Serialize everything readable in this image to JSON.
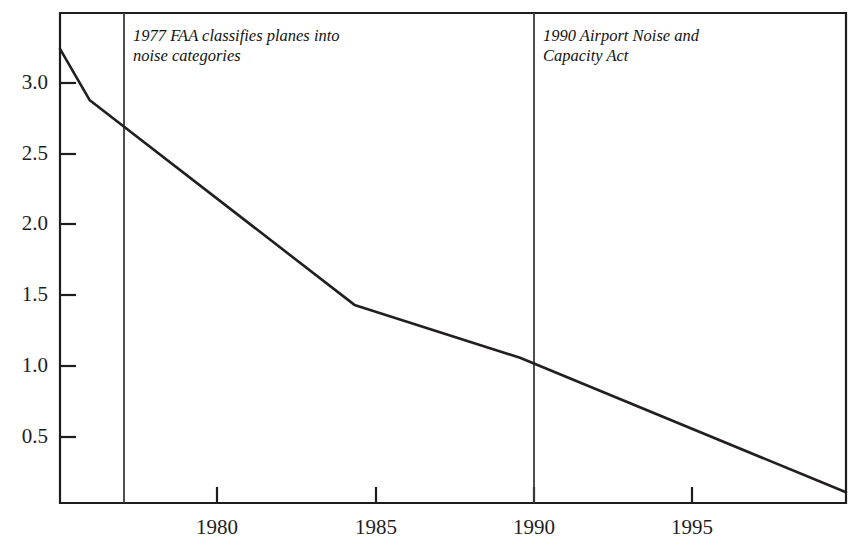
{
  "chart_data": {
    "type": "line",
    "title": "",
    "xlabel": "",
    "ylabel": "",
    "xlim": [
      1976.1,
      1999.85
    ],
    "ylim": [
      0.035,
      3.46
    ],
    "grid": false,
    "legend": null,
    "x": [
      1976.1,
      1977,
      1985,
      1990,
      1999.85
    ],
    "values": [
      3.21,
      2.85,
      1.42,
      1.05,
      0.11
    ],
    "series": [
      {
        "name": "noise-exposure-index",
        "x": [
          1976.1,
          1977,
          1985,
          1990,
          1999.85
        ],
        "values": [
          3.21,
          2.85,
          1.42,
          1.05,
          0.11
        ]
      }
    ],
    "yticks": [
      3.0,
      2.5,
      2.0,
      1.5,
      1.0,
      0.5
    ],
    "ytick_labels": [
      "3.0",
      "2.5",
      "2.0",
      "1.5",
      "1.0",
      "0.5"
    ],
    "xticks": [
      1980,
      1985,
      1990,
      1995
    ],
    "xtick_labels": [
      "1980",
      "1985",
      "1990",
      "1995"
    ],
    "annotations": [
      {
        "id": "faa-1977",
        "x": 1977,
        "text": "1977 FAA classifies planes into\nnoise categories",
        "rule": "vertical"
      },
      {
        "id": "airport-noise-act-1990",
        "x": 1990,
        "text": "1990 Airport Noise and\nCapacity Act",
        "rule": "vertical"
      }
    ],
    "colors": {
      "background": "#ffffff",
      "axis": "#1d1d1d",
      "data_line": "#231f20",
      "annotation_rule": "#3a3a3a",
      "text": "#1a1a1a"
    }
  }
}
